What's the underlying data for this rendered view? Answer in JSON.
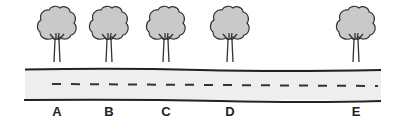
{
  "diagram": {
    "colors": {
      "canopy": "#c9c9c9",
      "outline": "#333333",
      "road": "#eeeeee",
      "edge": "#222222"
    },
    "trees": [
      {
        "label": "A",
        "x": 57
      },
      {
        "label": "B",
        "x": 109
      },
      {
        "label": "C",
        "x": 166
      },
      {
        "label": "D",
        "x": 230
      },
      {
        "label": "E",
        "x": 356
      }
    ],
    "road": {
      "x1": 25,
      "x2": 381,
      "top": 69,
      "bottom": 100,
      "center_line": "dashed"
    }
  }
}
